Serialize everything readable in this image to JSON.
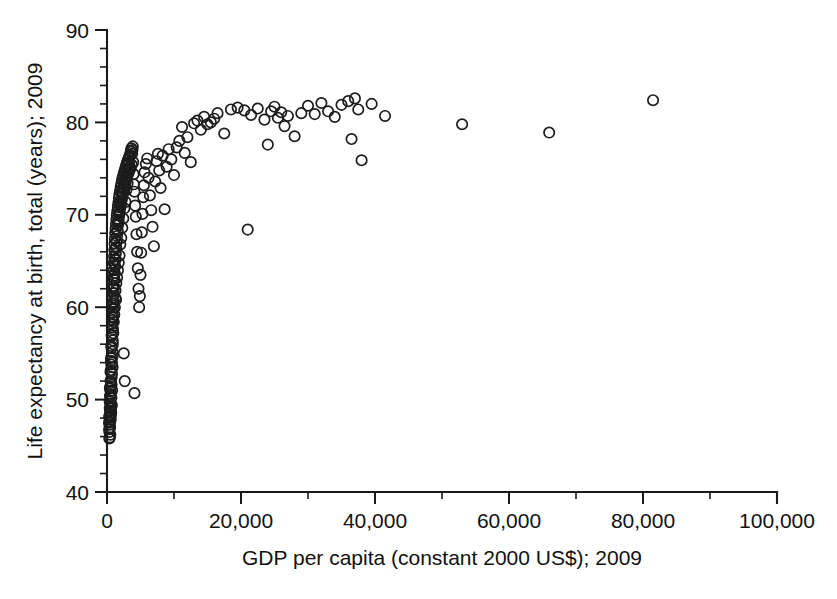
{
  "chart_data": {
    "type": "scatter",
    "title": "",
    "xlabel": "GDP per capita (constant 2000 US$); 2009",
    "ylabel": "Life expectancy at birth, total (years); 2009",
    "xlim": [
      0,
      100000
    ],
    "ylim": [
      40,
      90
    ],
    "x_ticks": [
      0,
      20000,
      40000,
      60000,
      80000,
      100000
    ],
    "x_tick_labels": [
      "0",
      "20,000",
      "40,000",
      "60,000",
      "80,000",
      "100,000"
    ],
    "x_minor_step": 10000,
    "y_ticks": [
      40,
      50,
      60,
      70,
      80,
      90
    ],
    "y_tick_labels": [
      "40",
      "50",
      "60",
      "70",
      "80",
      "90"
    ],
    "y_minor_step": 2,
    "grid": false,
    "legend": "none",
    "marker": "open-circle",
    "marker_color": "#1c1c1c",
    "marker_radius_px": 5.2,
    "series": [
      {
        "name": "Countries",
        "points": [
          [
            330,
            48.2
          ],
          [
            360,
            46.5
          ],
          [
            390,
            47.3
          ],
          [
            410,
            49.1
          ],
          [
            420,
            45.9
          ],
          [
            440,
            48.8
          ],
          [
            455,
            50.3
          ],
          [
            470,
            47.0
          ],
          [
            480,
            51.4
          ],
          [
            495,
            46.2
          ],
          [
            510,
            49.6
          ],
          [
            520,
            48.4
          ],
          [
            535,
            52.0
          ],
          [
            545,
            47.8
          ],
          [
            560,
            50.9
          ],
          [
            575,
            53.2
          ],
          [
            590,
            49.0
          ],
          [
            600,
            51.8
          ],
          [
            615,
            54.5
          ],
          [
            630,
            48.6
          ],
          [
            645,
            53.8
          ],
          [
            660,
            50.2
          ],
          [
            675,
            55.6
          ],
          [
            690,
            52.4
          ],
          [
            705,
            56.9
          ],
          [
            720,
            49.4
          ],
          [
            735,
            54.0
          ],
          [
            750,
            57.8
          ],
          [
            765,
            51.0
          ],
          [
            780,
            58.6
          ],
          [
            800,
            55.2
          ],
          [
            815,
            59.4
          ],
          [
            830,
            53.5
          ],
          [
            850,
            60.2
          ],
          [
            865,
            56.4
          ],
          [
            880,
            61.0
          ],
          [
            900,
            57.6
          ],
          [
            915,
            62.3
          ],
          [
            930,
            58.9
          ],
          [
            950,
            63.1
          ],
          [
            965,
            59.8
          ],
          [
            980,
            64.0
          ],
          [
            1000,
            60.6
          ],
          [
            1020,
            64.8
          ],
          [
            1040,
            61.5
          ],
          [
            1060,
            65.5
          ],
          [
            1080,
            62.2
          ],
          [
            1100,
            66.2
          ],
          [
            1120,
            63.0
          ],
          [
            1140,
            66.9
          ],
          [
            1160,
            63.7
          ],
          [
            1180,
            67.4
          ],
          [
            1200,
            64.4
          ],
          [
            1230,
            68.0
          ],
          [
            1260,
            65.1
          ],
          [
            1290,
            68.5
          ],
          [
            1320,
            65.8
          ],
          [
            1350,
            69.0
          ],
          [
            1380,
            66.5
          ],
          [
            1410,
            69.5
          ],
          [
            1440,
            67.1
          ],
          [
            1470,
            70.0
          ],
          [
            1500,
            67.7
          ],
          [
            1540,
            70.4
          ],
          [
            1580,
            68.3
          ],
          [
            1620,
            70.9
          ],
          [
            1660,
            68.9
          ],
          [
            1700,
            71.3
          ],
          [
            1740,
            69.4
          ],
          [
            1780,
            71.8
          ],
          [
            1820,
            69.9
          ],
          [
            1860,
            72.2
          ],
          [
            1900,
            70.3
          ],
          [
            1950,
            72.6
          ],
          [
            2000,
            70.8
          ],
          [
            2050,
            73.0
          ],
          [
            2100,
            71.2
          ],
          [
            2150,
            73.4
          ],
          [
            2200,
            71.6
          ],
          [
            2250,
            73.8
          ],
          [
            2300,
            72.0
          ],
          [
            2360,
            74.1
          ],
          [
            2420,
            72.4
          ],
          [
            2480,
            74.4
          ],
          [
            2540,
            72.8
          ],
          [
            2600,
            74.7
          ],
          [
            2660,
            73.1
          ],
          [
            2720,
            75.0
          ],
          [
            2780,
            73.5
          ],
          [
            2840,
            75.3
          ],
          [
            2900,
            73.9
          ],
          [
            2960,
            75.6
          ],
          [
            3020,
            74.2
          ],
          [
            3100,
            75.9
          ],
          [
            3180,
            74.5
          ],
          [
            3260,
            76.2
          ],
          [
            3340,
            74.9
          ],
          [
            3420,
            76.5
          ],
          [
            3500,
            75.1
          ],
          [
            3600,
            76.8
          ],
          [
            3700,
            75.4
          ],
          [
            3800,
            77.0
          ],
          [
            3900,
            75.7
          ],
          [
            4000,
            73.3
          ],
          [
            4100,
            72.5
          ],
          [
            4200,
            71.0
          ],
          [
            4300,
            69.8
          ],
          [
            4400,
            67.9
          ],
          [
            4500,
            66.0
          ],
          [
            4600,
            64.2
          ],
          [
            4700,
            62.0
          ],
          [
            4800,
            60.0
          ],
          [
            4900,
            61.2
          ],
          [
            5000,
            63.5
          ],
          [
            5100,
            65.9
          ],
          [
            5200,
            68.1
          ],
          [
            5300,
            70.1
          ],
          [
            5400,
            71.9
          ],
          [
            5500,
            73.2
          ],
          [
            5600,
            74.6
          ],
          [
            5800,
            75.5
          ],
          [
            6000,
            76.1
          ],
          [
            6200,
            74.0
          ],
          [
            6400,
            72.1
          ],
          [
            6600,
            70.5
          ],
          [
            6800,
            68.7
          ],
          [
            7000,
            66.6
          ],
          [
            7200,
            73.6
          ],
          [
            7400,
            75.8
          ],
          [
            7600,
            76.6
          ],
          [
            7800,
            74.8
          ],
          [
            8000,
            72.9
          ],
          [
            8300,
            76.4
          ],
          [
            8600,
            70.6
          ],
          [
            8900,
            75.2
          ],
          [
            9200,
            77.1
          ],
          [
            9600,
            76.0
          ],
          [
            10000,
            74.3
          ],
          [
            10400,
            77.3
          ],
          [
            10800,
            78.0
          ],
          [
            11200,
            79.5
          ],
          [
            11600,
            76.7
          ],
          [
            12000,
            78.4
          ],
          [
            12500,
            75.7
          ],
          [
            13000,
            79.9
          ],
          [
            13500,
            80.2
          ],
          [
            14000,
            79.2
          ],
          [
            14500,
            80.6
          ],
          [
            15000,
            79.8
          ],
          [
            15500,
            80.0
          ],
          [
            16000,
            80.4
          ],
          [
            16500,
            81.0
          ],
          [
            17500,
            78.8
          ],
          [
            18500,
            81.4
          ],
          [
            19500,
            81.6
          ],
          [
            20500,
            81.3
          ],
          [
            21000,
            68.4
          ],
          [
            21500,
            80.8
          ],
          [
            22500,
            81.5
          ],
          [
            23500,
            80.3
          ],
          [
            24000,
            77.6
          ],
          [
            24500,
            81.2
          ],
          [
            25000,
            81.7
          ],
          [
            25500,
            80.5
          ],
          [
            26000,
            81.1
          ],
          [
            26500,
            79.6
          ],
          [
            27000,
            80.7
          ],
          [
            28000,
            78.5
          ],
          [
            29000,
            81.0
          ],
          [
            30000,
            81.8
          ],
          [
            31000,
            80.9
          ],
          [
            32000,
            82.1
          ],
          [
            33000,
            81.2
          ],
          [
            34000,
            80.6
          ],
          [
            35000,
            81.9
          ],
          [
            36000,
            82.3
          ],
          [
            36500,
            78.2
          ],
          [
            37000,
            82.6
          ],
          [
            37500,
            81.4
          ],
          [
            38000,
            75.9
          ],
          [
            39500,
            82.0
          ],
          [
            41500,
            80.7
          ],
          [
            53000,
            79.8
          ],
          [
            66000,
            78.9
          ],
          [
            81500,
            82.4
          ],
          [
            1250,
            61.0
          ],
          [
            1350,
            60.8
          ],
          [
            2500,
            55.0
          ],
          [
            2650,
            52.0
          ],
          [
            4100,
            50.7
          ],
          [
            300,
            47.5
          ],
          [
            320,
            46.8
          ],
          [
            350,
            45.8
          ],
          [
            370,
            48.0
          ],
          [
            405,
            49.8
          ],
          [
            430,
            51.2
          ],
          [
            460,
            47.6
          ],
          [
            490,
            50.5
          ],
          [
            525,
            53.0
          ],
          [
            555,
            48.2
          ],
          [
            585,
            54.2
          ],
          [
            620,
            49.2
          ],
          [
            650,
            55.8
          ],
          [
            685,
            51.6
          ],
          [
            715,
            57.0
          ],
          [
            745,
            52.8
          ],
          [
            775,
            58.2
          ],
          [
            810,
            54.6
          ],
          [
            840,
            59.0
          ],
          [
            870,
            56.0
          ],
          [
            905,
            60.4
          ],
          [
            940,
            57.2
          ],
          [
            975,
            62.0
          ],
          [
            1010,
            58.4
          ],
          [
            1050,
            63.4
          ],
          [
            1090,
            59.2
          ],
          [
            1130,
            64.6
          ],
          [
            1170,
            60.0
          ],
          [
            1210,
            65.2
          ],
          [
            1270,
            61.8
          ],
          [
            1330,
            66.4
          ],
          [
            1390,
            62.6
          ],
          [
            1450,
            67.2
          ],
          [
            1510,
            63.2
          ],
          [
            1570,
            68.2
          ],
          [
            1630,
            64.0
          ],
          [
            1690,
            69.2
          ],
          [
            1750,
            64.8
          ],
          [
            1810,
            70.2
          ],
          [
            1870,
            65.6
          ],
          [
            1930,
            71.0
          ],
          [
            1990,
            66.8
          ],
          [
            2060,
            71.5
          ],
          [
            2130,
            67.5
          ],
          [
            2200,
            72.3
          ],
          [
            2280,
            68.6
          ],
          [
            2350,
            72.9
          ],
          [
            2430,
            69.6
          ],
          [
            2510,
            73.3
          ],
          [
            2590,
            70.7
          ],
          [
            2670,
            73.7
          ],
          [
            2750,
            71.4
          ],
          [
            2830,
            74.2
          ],
          [
            2910,
            72.7
          ],
          [
            2990,
            74.9
          ],
          [
            3070,
            73.4
          ],
          [
            3150,
            75.4
          ],
          [
            3230,
            74.6
          ],
          [
            3310,
            75.7
          ],
          [
            3390,
            76.3
          ],
          [
            3470,
            75.0
          ],
          [
            3550,
            76.9
          ],
          [
            3650,
            77.2
          ],
          [
            3750,
            76.6
          ],
          [
            3850,
            77.4
          ],
          [
            3950,
            74.4
          ]
        ]
      }
    ]
  },
  "axis": {
    "x_title": "GDP per capita (constant 2000 US$); 2009",
    "y_title": "Life expectancy at birth, total (years); 2009"
  }
}
